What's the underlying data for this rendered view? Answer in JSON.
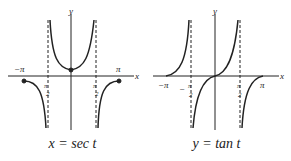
{
  "figures": [
    {
      "caption": "x = sec t",
      "axis_x": "x",
      "axis_y": "y",
      "ticks": [
        "-π",
        "-π/2",
        "π/2",
        "π"
      ]
    },
    {
      "caption": "y = tan t",
      "axis_x": "x",
      "axis_y": "y",
      "ticks": [
        "-π",
        "-π/2",
        "π/2",
        "π"
      ]
    }
  ],
  "labels": {
    "pi": "π",
    "neg_pi": "−π",
    "two": "2"
  }
}
